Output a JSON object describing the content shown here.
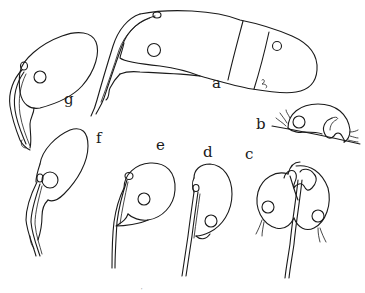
{
  "figure": {
    "type": "biological line illustration",
    "ink_color": "#1a1a1a",
    "background": "#ffffff",
    "panels": [
      {
        "id": "a",
        "label": "a",
        "description": "elongated segmented body with stalk, nucleus and terminal segments"
      },
      {
        "id": "b",
        "label": "b",
        "description": "dome-shaped cell on substrate line with cilia tufts"
      },
      {
        "id": "c",
        "label": "c",
        "description": "dividing heart-shaped cell pair on a stalk, two nuclei"
      },
      {
        "id": "d",
        "label": "d",
        "description": "ovoid cell on stalk with nucleus"
      },
      {
        "id": "e",
        "label": "e",
        "description": "rounded cell on curved stalk with nucleus"
      },
      {
        "id": "f",
        "label": "f",
        "description": "pear-shaped cell on branched stalk with nucleus"
      },
      {
        "id": "g",
        "label": "g",
        "description": "elongated oval cell on stalk with nucleus"
      }
    ],
    "speck": "'"
  }
}
